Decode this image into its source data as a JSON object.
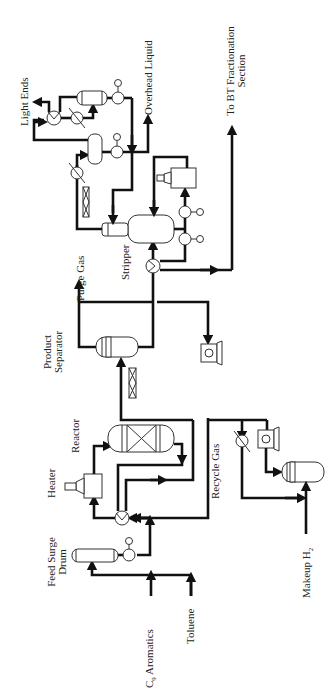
{
  "diagram": {
    "type": "process-flow-diagram",
    "orientation": "rotated-90-ccw",
    "labels": {
      "c9_aromatics": "C",
      "c9_subscript": "9",
      "c9_rest": " Aromatics",
      "toluene": "Toluene",
      "feed_surge_drum_line1": "Feed Surge",
      "feed_surge_drum_line2": "Drum",
      "heater": "Heater",
      "reactor": "Reactor",
      "recycle_gas": "Recycle Gas",
      "makeup_h2": "Makeup H",
      "makeup_h2_subscript": "2",
      "product_separator_line1": "Product",
      "product_separator_line2": "Separator",
      "purge_gas": "Purge Gas",
      "stripper": "Stripper",
      "light_ends": "Light Ends",
      "overhead_liquid": "Overhead Liquid",
      "to_bt_line1": "To BT Fractionation",
      "to_bt_line2": "Section"
    },
    "nodes": [
      {
        "id": "feed-surge-drum",
        "label": "Feed Surge Drum",
        "kind": "horizontal-drum"
      },
      {
        "id": "feed-pump",
        "kind": "pump"
      },
      {
        "id": "feed-effluent-exchanger",
        "kind": "heat-exchanger"
      },
      {
        "id": "heater",
        "label": "Heater",
        "kind": "fired-heater"
      },
      {
        "id": "reactor",
        "label": "Reactor",
        "kind": "packed-reactor"
      },
      {
        "id": "air-cooler-1",
        "kind": "air-cooler"
      },
      {
        "id": "product-separator",
        "label": "Product Separator",
        "kind": "separator"
      },
      {
        "id": "recycle-compressor",
        "kind": "compressor"
      },
      {
        "id": "makeup-cooler",
        "kind": "cooler"
      },
      {
        "id": "makeup-compressor",
        "kind": "compressor"
      },
      {
        "id": "makeup-drum",
        "kind": "drum"
      },
      {
        "id": "stripper-exchanger",
        "kind": "heat-exchanger"
      },
      {
        "id": "stripper",
        "label": "Stripper",
        "kind": "column"
      },
      {
        "id": "reboiler-heater",
        "kind": "fired-heater"
      },
      {
        "id": "stripper-pump-1",
        "kind": "pump"
      },
      {
        "id": "stripper-pump-2",
        "kind": "pump"
      },
      {
        "id": "air-cooler-2",
        "kind": "air-cooler"
      },
      {
        "id": "overhead-condenser",
        "kind": "cooler"
      },
      {
        "id": "overhead-drum",
        "kind": "vertical-drum"
      },
      {
        "id": "overhead-pump",
        "kind": "pump"
      },
      {
        "id": "le-exchanger",
        "kind": "heat-exchanger"
      },
      {
        "id": "le-cooler",
        "kind": "cooler"
      },
      {
        "id": "le-drum",
        "kind": "horizontal-drum"
      },
      {
        "id": "le-pump",
        "kind": "pump"
      }
    ],
    "streams_out": [
      "Light Ends",
      "Overhead Liquid",
      "To BT Fractionation Section",
      "Purge Gas"
    ],
    "streams_in": [
      "C9 Aromatics",
      "Toluene",
      "Makeup H2"
    ]
  }
}
